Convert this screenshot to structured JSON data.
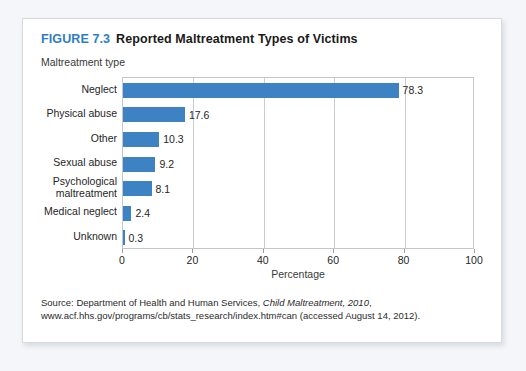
{
  "figure": {
    "number_label": "FIGURE 7.3",
    "title": "Reported Maltreatment Types of Victims",
    "accent_color": "#2f7dc4",
    "bar_color": "#3d83c4"
  },
  "source_note": {
    "prefix": "Source: Department of Health and Human Services, ",
    "italic": "Child Maltreatment, 2010",
    "suffix": ", www.acf.hhs.gov/programs/cb/stats_research/index.htm#can (accessed August 14, 2012)."
  },
  "chart_data": {
    "type": "bar",
    "orientation": "horizontal",
    "title": "Reported Maltreatment Types of Victims",
    "xlabel": "Percentage",
    "ylabel": "Maltreatment type",
    "xlim": [
      0,
      100
    ],
    "xticks": [
      0,
      20,
      40,
      60,
      80,
      100
    ],
    "grid": true,
    "categories": [
      "Neglect",
      "Physical abuse",
      "Other",
      "Sexual abuse",
      "Psychological\nmaltreatment",
      "Medical neglect",
      "Unknown"
    ],
    "values": [
      78.3,
      17.6,
      10.3,
      9.2,
      8.1,
      2.4,
      0.3
    ],
    "value_labels": [
      "78.3",
      "17.6",
      "10.3",
      "9.2",
      "8.1",
      "2.4",
      "0.3"
    ]
  }
}
